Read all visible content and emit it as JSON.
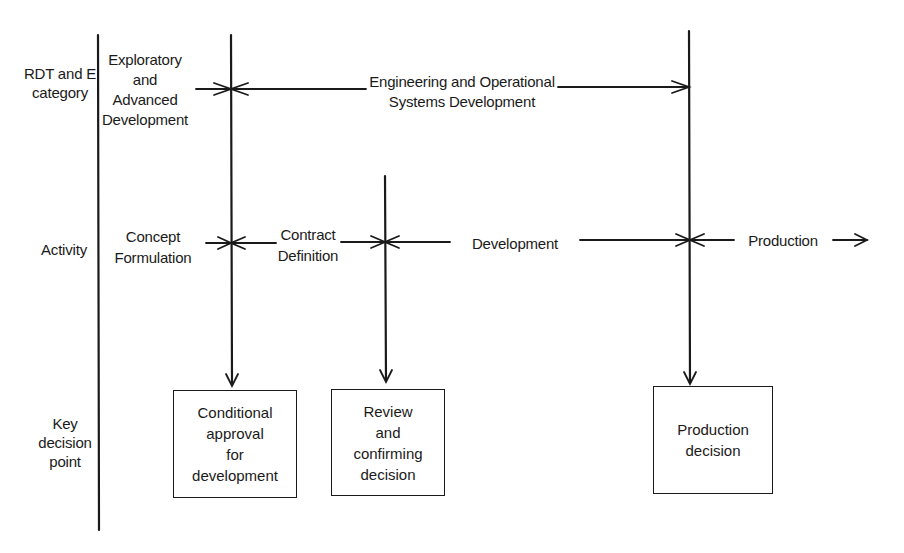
{
  "rows": {
    "category": "RDT and E\ncategory",
    "activity": "Activity",
    "decision": "Key\ndecision\npoint"
  },
  "categories": {
    "exploratory": "Exploratory\nand\nAdvanced\nDevelopment",
    "engineering": "Engineering and Operational\nSystems Development"
  },
  "activities": {
    "concept": "Concept\nFormulation",
    "contract": "Contract\nDefinition",
    "development": "Development",
    "production": "Production"
  },
  "decisions": [
    {
      "label": "Conditional\napproval\nfor\ndevelopment"
    },
    {
      "label": "Review\nand\nconfirming\ndecision"
    },
    {
      "label": "Production\ndecision"
    }
  ]
}
